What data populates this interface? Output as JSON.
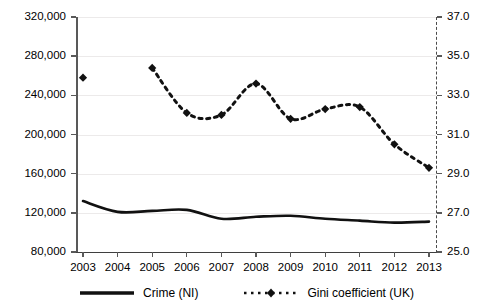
{
  "chart_data": {
    "type": "line",
    "title": "",
    "xlabel": "",
    "ylabel": "",
    "grid": true,
    "legend_position": "bottom",
    "x": [
      2003,
      2004,
      2005,
      2006,
      2007,
      2008,
      2009,
      2010,
      2011,
      2012,
      2013
    ],
    "x_tick_labels": [
      "2003",
      "2004",
      "2005",
      "2006",
      "2007",
      "2008",
      "2009",
      "2010",
      "2011",
      "2012",
      "2013"
    ],
    "axes": {
      "left": {
        "label": "",
        "ylim": [
          80000,
          320000
        ],
        "tick_values": [
          80000,
          120000,
          160000,
          200000,
          240000,
          280000,
          320000
        ],
        "tick_labels": [
          "80,000",
          "120,000",
          "160,000",
          "200,000",
          "240,000",
          "280,000",
          "320,000"
        ]
      },
      "right": {
        "label": "",
        "ylim": [
          25.0,
          37.0
        ],
        "tick_values": [
          25.0,
          27.0,
          29.0,
          31.0,
          33.0,
          35.0,
          37.0
        ],
        "tick_labels": [
          "25.0",
          "27.0",
          "29.0",
          "31.0",
          "33.0",
          "35.0",
          "37.0"
        ]
      }
    },
    "series": [
      {
        "name": "Crime (NI)",
        "axis": "left",
        "style": "solid",
        "marker": "none",
        "color": "#111111",
        "values": [
          132000,
          121000,
          122000,
          123000,
          114000,
          116000,
          117000,
          114000,
          112000,
          110000,
          111000
        ]
      },
      {
        "name": "Gini coefficient (UK)",
        "axis": "right",
        "style": "dashed",
        "marker": "diamond",
        "color": "#111111",
        "values": [
          33.9,
          null,
          34.4,
          32.1,
          32.0,
          33.6,
          31.8,
          32.3,
          32.4,
          30.5,
          29.3
        ]
      }
    ]
  },
  "legend": {
    "items": [
      {
        "label": "Crime (NI)",
        "style": "solid"
      },
      {
        "label": "Gini coefficient (UK)",
        "style": "dashed-diamond"
      }
    ]
  }
}
